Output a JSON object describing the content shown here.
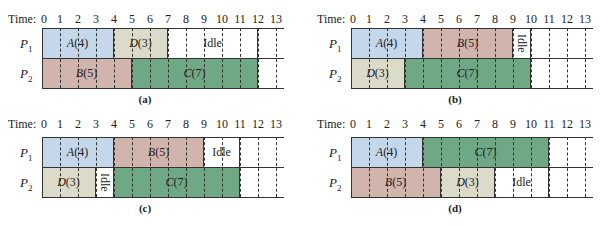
{
  "time_label": "Time:",
  "ticks": [
    "0",
    "1",
    "2",
    "3",
    "4",
    "5",
    "6",
    "7",
    "8",
    "9",
    "10",
    "11",
    "12",
    "13"
  ],
  "rows": [
    {
      "name": "P",
      "sub": "1"
    },
    {
      "name": "P",
      "sub": "2"
    }
  ],
  "colors": {
    "A": "#c5d7ea",
    "B": "#d1b4ac",
    "C": "#6fa885",
    "D": "#dcdbc9",
    "Idle": "#ffffff"
  },
  "panels": [
    {
      "caption": "(a)",
      "p1": [
        {
          "task": "A",
          "dur": "4",
          "start": 0,
          "end": 4
        },
        {
          "task": "D",
          "dur": "3",
          "start": 4,
          "end": 7
        },
        {
          "task": "Idle",
          "start": 7,
          "end": 12
        }
      ],
      "p2": [
        {
          "task": "B",
          "dur": "5",
          "start": 0,
          "end": 5
        },
        {
          "task": "C",
          "dur": "7",
          "start": 5,
          "end": 12
        }
      ]
    },
    {
      "caption": "(b)",
      "p1": [
        {
          "task": "A",
          "dur": "4",
          "start": 0,
          "end": 4
        },
        {
          "task": "B",
          "dur": "5",
          "start": 4,
          "end": 9
        },
        {
          "task": "Idle",
          "start": 9,
          "end": 10,
          "vertical": true
        }
      ],
      "p2": [
        {
          "task": "D",
          "dur": "3",
          "start": 0,
          "end": 3
        },
        {
          "task": "C",
          "dur": "7",
          "start": 3,
          "end": 10
        }
      ]
    },
    {
      "caption": "(c)",
      "p1": [
        {
          "task": "A",
          "dur": "4",
          "start": 0,
          "end": 4
        },
        {
          "task": "B",
          "dur": "5",
          "start": 4,
          "end": 9
        },
        {
          "task": "Idle",
          "start": 9,
          "end": 11
        }
      ],
      "p2": [
        {
          "task": "D",
          "dur": "3",
          "start": 0,
          "end": 3
        },
        {
          "task": "Idle",
          "start": 3,
          "end": 4,
          "vertical": true
        },
        {
          "task": "C",
          "dur": "7",
          "start": 4,
          "end": 11
        }
      ]
    },
    {
      "caption": "(d)",
      "p1": [
        {
          "task": "A",
          "dur": "4",
          "start": 0,
          "end": 4
        },
        {
          "task": "C",
          "dur": "7",
          "start": 4,
          "end": 11
        }
      ],
      "p2": [
        {
          "task": "B",
          "dur": "5",
          "start": 0,
          "end": 5
        },
        {
          "task": "D",
          "dur": "3",
          "start": 5,
          "end": 8
        },
        {
          "task": "Idle",
          "start": 8,
          "end": 11
        }
      ]
    }
  ]
}
